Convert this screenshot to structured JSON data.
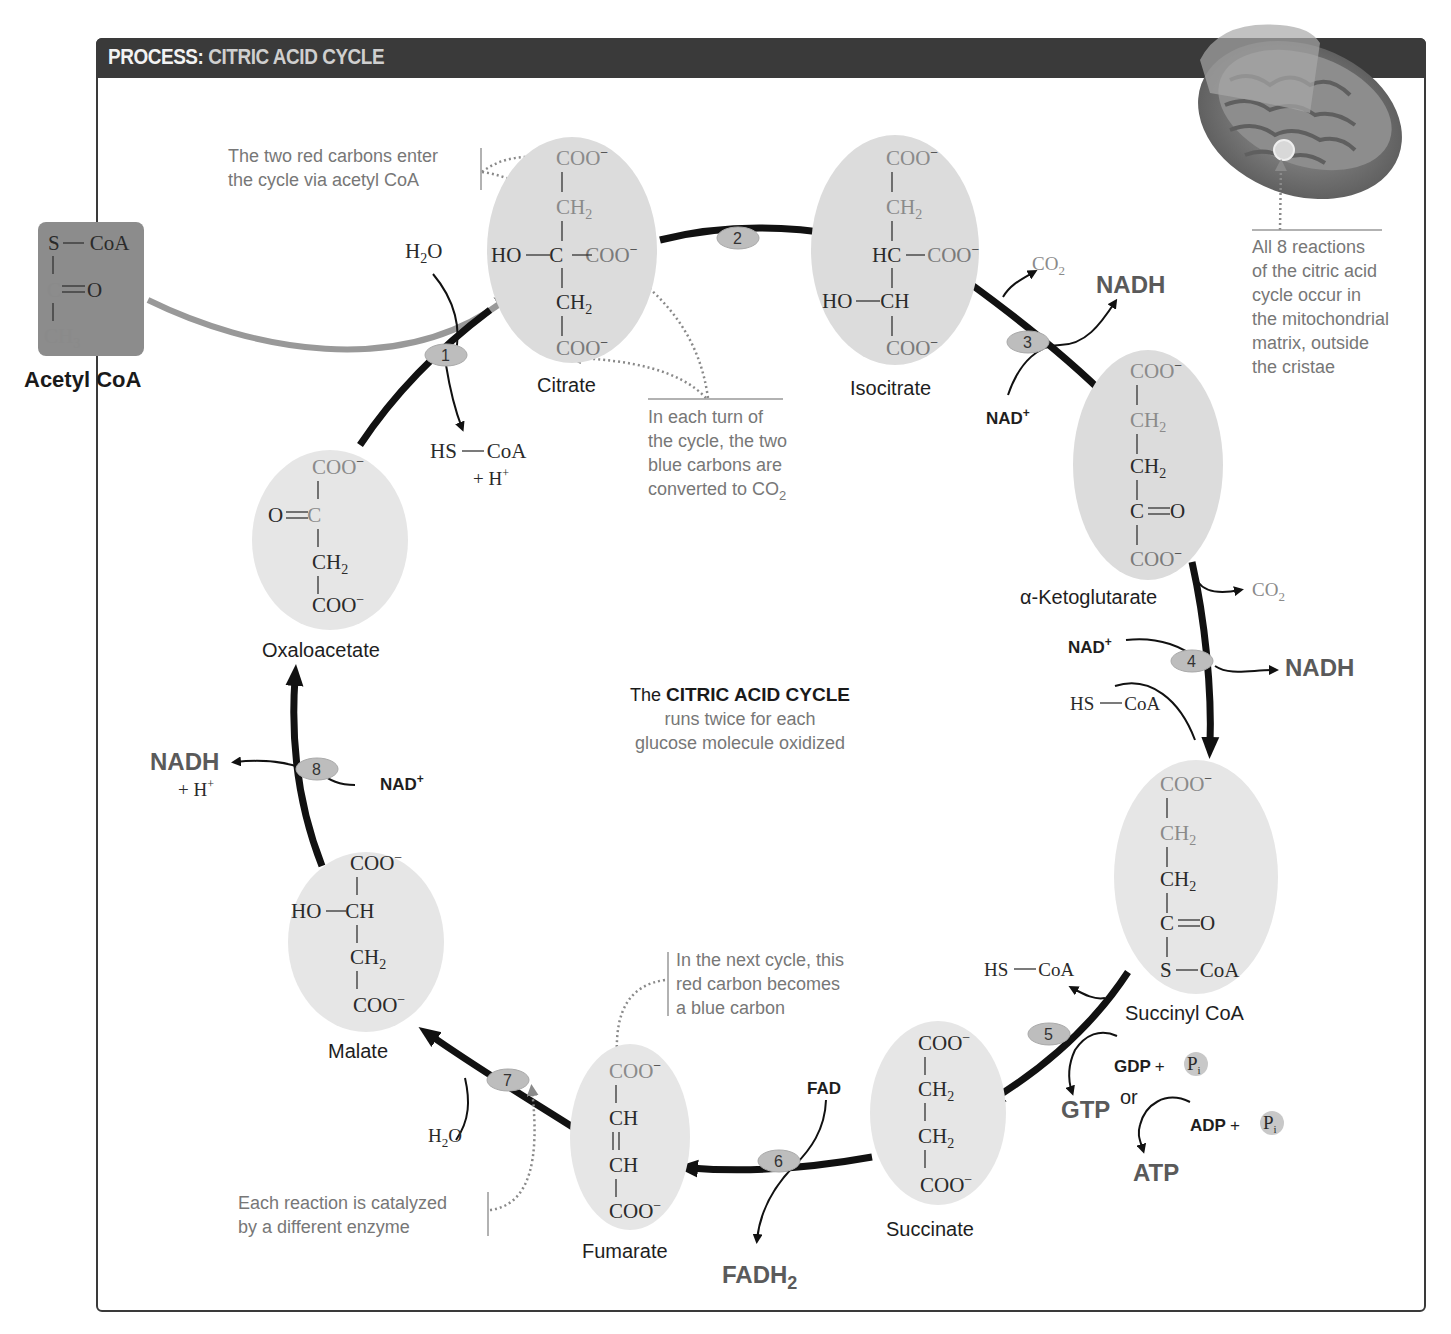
{
  "header": {
    "title_prefix": "PROCESS:",
    "title_main": "CITRIC ACID CYCLE"
  },
  "acetyl_coa": {
    "label": "Acetyl CoA",
    "formula": {
      "line1_s": "S",
      "line1_coa": "CoA",
      "line2_c": "C",
      "line2_o": "O",
      "line3": "CH",
      "line3_sub": "3"
    }
  },
  "molecules": {
    "citrate": {
      "label": "Citrate",
      "coo": "COO",
      "ch2": "CH",
      "sub2": "2",
      "ho": "HO",
      "c": "C",
      "minus": "−"
    },
    "isocitrate": {
      "label": "Isocitrate",
      "coo": "COO",
      "ch2": "CH",
      "hc": "HC",
      "ho": "HO",
      "ch": "CH",
      "sub2": "2",
      "minus": "−"
    },
    "alpha_ketoglutarate": {
      "label": "α-Ketoglutarate",
      "coo": "COO",
      "ch2": "CH",
      "c": "C",
      "o": "O",
      "sub2": "2",
      "minus": "−"
    },
    "succinyl_coa": {
      "label": "Succinyl CoA",
      "coo": "COO",
      "ch2": "CH",
      "c": "C",
      "o": "O",
      "s": "S",
      "coa": "CoA",
      "sub2": "2",
      "minus": "−"
    },
    "succinate": {
      "label": "Succinate",
      "coo": "COO",
      "ch2": "CH",
      "sub2": "2",
      "minus": "−"
    },
    "fumarate": {
      "label": "Fumarate",
      "coo": "COO",
      "ch": "CH",
      "minus": "−"
    },
    "malate": {
      "label": "Malate",
      "coo": "COO",
      "ho": "HO",
      "ch": "CH",
      "ch2": "CH",
      "sub2": "2",
      "minus": "−"
    },
    "oxaloacetate": {
      "label": "Oxaloacetate",
      "coo": "COO",
      "o": "O",
      "c": "C",
      "ch2": "CH",
      "sub2": "2",
      "minus": "−"
    }
  },
  "steps": [
    "1",
    "2",
    "3",
    "4",
    "5",
    "6",
    "7",
    "8"
  ],
  "reactants": {
    "step1_in": {
      "h2o": "H",
      "sub": "2",
      "o": "O"
    },
    "step1_out": {
      "hs": "HS",
      "coa": "CoA",
      "hplus": "+ H",
      "sup": "+"
    },
    "step3_co2": {
      "co": "CO",
      "sub": "2"
    },
    "step3_nadh": "NADH",
    "step3_nad": "NAD",
    "step4_co2": {
      "co": "CO",
      "sub": "2"
    },
    "step4_nad": "NAD",
    "step4_nadh": "NADH",
    "step4_hscoa": {
      "hs": "HS",
      "coa": "CoA"
    },
    "step5_hscoa": {
      "hs": "HS",
      "coa": "CoA"
    },
    "step5_gdp": "GDP",
    "step5_gtp": "GTP",
    "step5_or": "or",
    "step5_adp": "ADP",
    "step5_atp": "ATP",
    "pi": {
      "p": "P",
      "sub": "i"
    },
    "plus": "+",
    "step6_fad": "FAD",
    "step6_fadh2": {
      "main": "FADH",
      "sub": "2"
    },
    "step7_h2o": {
      "h": "H",
      "sub": "2",
      "o": "O"
    },
    "step8_nadh": "NADH",
    "step8_hplus": {
      "main": "+ H",
      "sup": "+"
    },
    "step8_nad": "NAD",
    "plus_sup": "+"
  },
  "notes": {
    "red_carbons": [
      "The two red carbons enter",
      "the cycle via acetyl CoA"
    ],
    "blue_carbons": [
      "In each turn of",
      "the cycle, the two",
      "blue carbons are",
      "converted to CO"
    ],
    "blue_carbons_sub": "2",
    "mitochondria": [
      "All 8 reactions",
      "of the citric acid",
      "cycle occur in",
      "the mitochondrial",
      "matrix, outside",
      "the cristae"
    ],
    "next_cycle": [
      "In the next cycle, this",
      "red carbon becomes",
      "a blue carbon"
    ],
    "enzyme": [
      "Each reaction is catalyzed",
      "by a different enzyme"
    ]
  },
  "center": {
    "line1_pre": "The",
    "line1_bold": "CITRIC ACID CYCLE",
    "line2": "runs twice for each",
    "line3": "glucose molecule oxidized"
  },
  "colors": {
    "title_bar": "#3a3a3a",
    "ellipse_fill": "#dcdcdc",
    "enzyme_badge": "#bdbdbd",
    "arrow": "#111111",
    "acetyl_box": "#8c8c8c"
  }
}
